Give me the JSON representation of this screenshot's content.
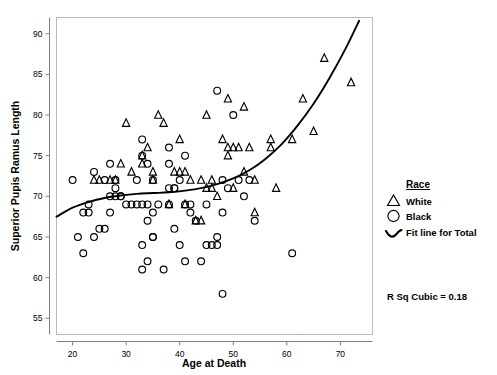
{
  "chart_data": {
    "type": "scatter",
    "title": "",
    "xlabel": "Age at Death",
    "ylabel": "Superior Pupis Ramus Length",
    "xlim": [
      17,
      76
    ],
    "ylim": [
      53,
      92
    ],
    "xticks": [
      20,
      30,
      40,
      50,
      60,
      70
    ],
    "yticks": [
      55,
      60,
      65,
      70,
      75,
      80,
      85,
      90
    ],
    "grid": false,
    "legend_position": "right",
    "legend": {
      "title": "Race",
      "entries": [
        {
          "label": "White",
          "marker": "triangle"
        },
        {
          "label": "Black",
          "marker": "circle"
        },
        {
          "label": "Fit line for Total",
          "marker": "curve"
        }
      ]
    },
    "annotations": [
      {
        "text": "R Sq Cubic = 0.18",
        "x": 0.85,
        "y": 0.2
      }
    ],
    "series": [
      {
        "name": "White",
        "marker": "triangle",
        "points": [
          [
            24,
            72
          ],
          [
            25,
            72
          ],
          [
            27,
            72
          ],
          [
            28,
            72
          ],
          [
            29,
            74
          ],
          [
            30,
            79
          ],
          [
            31,
            73
          ],
          [
            33,
            75
          ],
          [
            33,
            74
          ],
          [
            34,
            76
          ],
          [
            35,
            72
          ],
          [
            35,
            73
          ],
          [
            36,
            80
          ],
          [
            37,
            79
          ],
          [
            38,
            69
          ],
          [
            39,
            73
          ],
          [
            40,
            73
          ],
          [
            40,
            77
          ],
          [
            41,
            73
          ],
          [
            41,
            69
          ],
          [
            42,
            72
          ],
          [
            43,
            67
          ],
          [
            44,
            72
          ],
          [
            44,
            67
          ],
          [
            45,
            80
          ],
          [
            45,
            71
          ],
          [
            46,
            71
          ],
          [
            46,
            72
          ],
          [
            47,
            70
          ],
          [
            48,
            77
          ],
          [
            49,
            76
          ],
          [
            49,
            82
          ],
          [
            49,
            75
          ],
          [
            50,
            76
          ],
          [
            50,
            71
          ],
          [
            51,
            76
          ],
          [
            52,
            73
          ],
          [
            52,
            81
          ],
          [
            53,
            76
          ],
          [
            54,
            68
          ],
          [
            54,
            72
          ],
          [
            57,
            77
          ],
          [
            57,
            76
          ],
          [
            58,
            71
          ],
          [
            61,
            77
          ],
          [
            63,
            82
          ],
          [
            65,
            78
          ],
          [
            67,
            87
          ],
          [
            72,
            84
          ]
        ]
      },
      {
        "name": "Black",
        "marker": "circle",
        "points": [
          [
            20,
            72
          ],
          [
            21,
            65
          ],
          [
            22,
            63
          ],
          [
            22,
            68
          ],
          [
            23,
            68
          ],
          [
            23,
            69
          ],
          [
            24,
            73
          ],
          [
            24,
            65
          ],
          [
            25,
            66
          ],
          [
            26,
            66
          ],
          [
            26,
            72
          ],
          [
            27,
            74
          ],
          [
            27,
            70
          ],
          [
            27,
            68
          ],
          [
            28,
            70
          ],
          [
            28,
            71
          ],
          [
            28,
            72
          ],
          [
            29,
            70
          ],
          [
            29,
            70
          ],
          [
            30,
            69
          ],
          [
            31,
            69
          ],
          [
            32,
            72
          ],
          [
            32,
            69
          ],
          [
            33,
            77
          ],
          [
            33,
            75
          ],
          [
            33,
            69
          ],
          [
            33,
            64
          ],
          [
            33,
            61
          ],
          [
            34,
            74
          ],
          [
            34,
            69
          ],
          [
            34,
            62
          ],
          [
            34,
            67
          ],
          [
            35,
            72
          ],
          [
            35,
            65
          ],
          [
            35,
            65
          ],
          [
            35,
            68
          ],
          [
            36,
            69
          ],
          [
            37,
            61
          ],
          [
            38,
            76
          ],
          [
            38,
            71
          ],
          [
            38,
            74
          ],
          [
            38,
            69
          ],
          [
            39,
            66
          ],
          [
            39,
            71
          ],
          [
            39,
            71
          ],
          [
            40,
            64
          ],
          [
            40,
            72
          ],
          [
            41,
            75
          ],
          [
            41,
            69
          ],
          [
            41,
            62
          ],
          [
            42,
            68
          ],
          [
            42,
            69
          ],
          [
            43,
            67
          ],
          [
            44,
            62
          ],
          [
            45,
            64
          ],
          [
            45,
            69
          ],
          [
            46,
            64
          ],
          [
            47,
            65
          ],
          [
            47,
            83
          ],
          [
            47,
            64
          ],
          [
            48,
            58
          ],
          [
            48,
            68
          ],
          [
            48,
            72
          ],
          [
            49,
            71
          ],
          [
            50,
            80
          ],
          [
            51,
            72
          ],
          [
            52,
            70
          ],
          [
            53,
            72
          ],
          [
            54,
            67
          ],
          [
            61,
            63
          ]
        ]
      }
    ],
    "fit_line": {
      "name": "Fit line for Total",
      "type": "cubic",
      "r_squared": 0.18,
      "points": [
        [
          17,
          67.5
        ],
        [
          20,
          68.6
        ],
        [
          23,
          69.3
        ],
        [
          26,
          69.8
        ],
        [
          29,
          70.1
        ],
        [
          32,
          70.3
        ],
        [
          35,
          70.4
        ],
        [
          38,
          70.5
        ],
        [
          41,
          70.7
        ],
        [
          44,
          71.0
        ],
        [
          47,
          71.5
        ],
        [
          50,
          72.2
        ],
        [
          53,
          73.2
        ],
        [
          56,
          74.6
        ],
        [
          59,
          76.4
        ],
        [
          62,
          78.7
        ],
        [
          65,
          81.4
        ],
        [
          68,
          84.6
        ],
        [
          71,
          88.2
        ],
        [
          73.5,
          91.6
        ]
      ]
    }
  }
}
